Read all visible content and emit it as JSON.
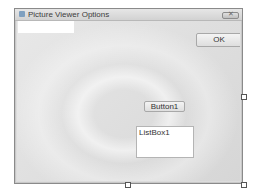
{
  "window": {
    "title": "Picture Viewer Options",
    "icon": "form-icon",
    "close_glyph": "✕"
  },
  "form": {
    "textbox": {
      "value": "",
      "placeholder": ""
    },
    "ok_button": {
      "label": "OK"
    },
    "button1": {
      "label": "Button1"
    },
    "listbox": {
      "items": [
        "ListBox1"
      ]
    }
  },
  "designer": {
    "grid": true,
    "selection_handles": [
      "right",
      "bottom",
      "bottom-right"
    ]
  }
}
